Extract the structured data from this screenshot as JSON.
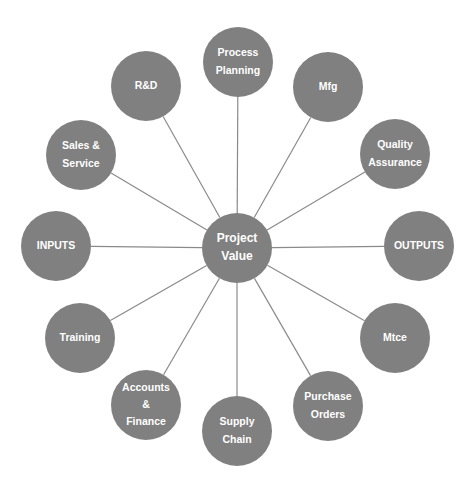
{
  "diagram": {
    "type": "hub-and-spoke",
    "colors": {
      "node_fill": "#808080",
      "spoke_stroke": "#8a8a8a",
      "label_text": "#ffffff",
      "background": "#ffffff"
    },
    "hub": {
      "id": "project-value",
      "lines": [
        "Project",
        "Value"
      ],
      "cx": 237,
      "cy": 248,
      "r": 35
    },
    "nodes": [
      {
        "id": "process-planning",
        "lines": [
          "Process",
          "Planning"
        ],
        "cx": 238,
        "cy": 62,
        "r": 35
      },
      {
        "id": "mfg",
        "lines": [
          "Mfg"
        ],
        "cx": 328,
        "cy": 87,
        "r": 35
      },
      {
        "id": "quality-assurance",
        "lines": [
          "Quality",
          "Assurance"
        ],
        "cx": 395,
        "cy": 154,
        "r": 35
      },
      {
        "id": "outputs",
        "lines": [
          "OUTPUTS"
        ],
        "cx": 419,
        "cy": 246,
        "r": 35
      },
      {
        "id": "mtce",
        "lines": [
          "Mtce"
        ],
        "cx": 395,
        "cy": 338,
        "r": 35
      },
      {
        "id": "purchase-orders",
        "lines": [
          "Purchase",
          "Orders"
        ],
        "cx": 328,
        "cy": 406,
        "r": 35
      },
      {
        "id": "supply-chain",
        "lines": [
          "Supply",
          "Chain"
        ],
        "cx": 237,
        "cy": 431,
        "r": 35
      },
      {
        "id": "accounts-finance",
        "lines": [
          "Accounts",
          "&",
          "Finance"
        ],
        "cx": 146,
        "cy": 405,
        "r": 35
      },
      {
        "id": "training",
        "lines": [
          "Training"
        ],
        "cx": 80,
        "cy": 338,
        "r": 35
      },
      {
        "id": "inputs",
        "lines": [
          "INPUTS"
        ],
        "cx": 56,
        "cy": 246,
        "r": 35
      },
      {
        "id": "sales-service",
        "lines": [
          "Sales &",
          "Service"
        ],
        "cx": 81,
        "cy": 155,
        "r": 35
      },
      {
        "id": "rd",
        "lines": [
          "R&D"
        ],
        "cx": 146,
        "cy": 86,
        "r": 35
      }
    ]
  }
}
